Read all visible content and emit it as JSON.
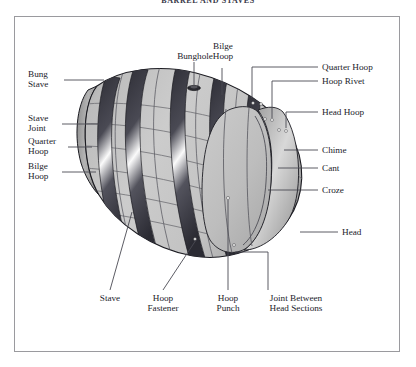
{
  "page": {
    "title": "BARREL AND STAVES",
    "background_color": "#ffffff",
    "frame_color": "#9a9a9e",
    "text_color": "#23232b",
    "leader_color": "#4a4a52"
  },
  "diagram": {
    "subject": "barrel",
    "style": "grayscale line illustration",
    "body_color": "#c6c6c6",
    "body_shadow_color": "#9b9b9b",
    "hoop_dark_color": "#3d3d45",
    "hoop_light_color": "#f2f2f2",
    "head_color": "#bdbdbd",
    "outline_color": "#1c1c22"
  },
  "labels": {
    "top": [
      {
        "text": "Bunghole",
        "name": "bunghole"
      },
      {
        "text": "Bilge\nHoop",
        "name": "bilge-hoop-top"
      }
    ],
    "left": [
      {
        "text": "Bung\nStave",
        "name": "bung-stave"
      },
      {
        "text": "Stave\nJoint",
        "name": "stave-joint"
      },
      {
        "text": "Quarter\nHoop",
        "name": "quarter-hoop-left"
      },
      {
        "text": "Bilge\nHoop",
        "name": "bilge-hoop-left"
      }
    ],
    "right": [
      {
        "text": "Quarter Hoop",
        "name": "quarter-hoop-right"
      },
      {
        "text": "Hoop Rivet",
        "name": "hoop-rivet"
      },
      {
        "text": "Head Hoop",
        "name": "head-hoop"
      },
      {
        "text": "Chime",
        "name": "chime"
      },
      {
        "text": "Cant",
        "name": "cant"
      },
      {
        "text": "Croze",
        "name": "croze"
      },
      {
        "text": "Head",
        "name": "head"
      }
    ],
    "bottom": [
      {
        "text": "Stave",
        "name": "stave"
      },
      {
        "text": "Hoop\nFastener",
        "name": "hoop-fastener"
      },
      {
        "text": "Hoop\nPunch",
        "name": "hoop-punch"
      },
      {
        "text": "Joint Between\nHead Sections",
        "name": "joint-between-head-sections"
      }
    ]
  }
}
